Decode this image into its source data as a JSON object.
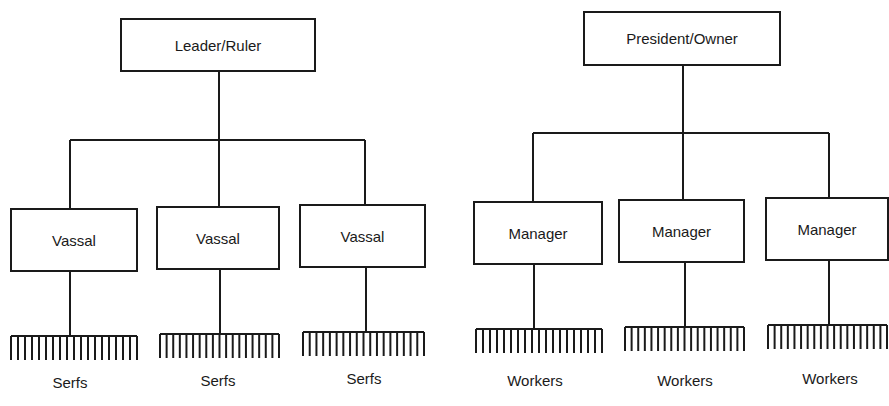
{
  "diagrams": [
    {
      "name": "feudal-hierarchy",
      "top": {
        "label": "Leader/Ruler"
      },
      "middle": [
        {
          "label": "Vassal"
        },
        {
          "label": "Vassal"
        },
        {
          "label": "Vassal"
        }
      ],
      "bottom": [
        {
          "label": "Serfs"
        },
        {
          "label": "Serfs"
        },
        {
          "label": "Serfs"
        }
      ]
    },
    {
      "name": "business-hierarchy",
      "top": {
        "label": "President/Owner"
      },
      "middle": [
        {
          "label": "Manager"
        },
        {
          "label": "Manager"
        },
        {
          "label": "Manager"
        }
      ],
      "bottom": [
        {
          "label": "Workers"
        },
        {
          "label": "Workers"
        },
        {
          "label": "Workers"
        }
      ]
    }
  ]
}
